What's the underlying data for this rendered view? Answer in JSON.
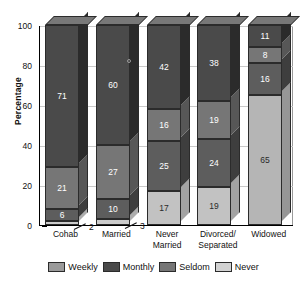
{
  "chart_data": {
    "type": "bar",
    "subtype": "stacked-3d-column",
    "title": "",
    "xlabel": "",
    "ylabel": "Percentage",
    "ylim": [
      0,
      100
    ],
    "yticks": [
      0,
      20,
      40,
      60,
      80,
      100
    ],
    "grid": true,
    "legend_position": "bottom",
    "categories": [
      "Cohab",
      "Married",
      "Never Married",
      "Divorced/ Separated",
      "Widowed"
    ],
    "category_lines": [
      [
        "Cohab",
        ""
      ],
      [
        "Married",
        ""
      ],
      [
        "Never",
        "Married"
      ],
      [
        "Divorced/",
        "Separated"
      ],
      [
        "Widowed",
        ""
      ]
    ],
    "stack_order_bottom_to_top": [
      "Never",
      "Seldom",
      "Monthly",
      "Weekly"
    ],
    "series": [
      {
        "name": "Weekly",
        "color": "#9a9a9a",
        "values": [
          71,
          60,
          42,
          38,
          11
        ]
      },
      {
        "name": "Monthly",
        "color": "#4a4a4a",
        "values": [
          21,
          27,
          16,
          19,
          8
        ]
      },
      {
        "name": "Seldom",
        "color": "#737373",
        "values": [
          6,
          10,
          25,
          24,
          16
        ]
      },
      {
        "name": "Never",
        "color": "#c9c9c9",
        "values": [
          2,
          3,
          17,
          19,
          65
        ]
      }
    ],
    "bar_segments": [
      {
        "category": "Cohab",
        "segments": [
          {
            "series": "Weekly",
            "value": 71,
            "label": "71",
            "color": "#4a4a4a",
            "label_color": "light",
            "callout": false
          },
          {
            "series": "Monthly",
            "value": 21,
            "label": "21",
            "color": "#767676",
            "label_color": "light",
            "callout": false
          },
          {
            "series": "Seldom",
            "value": 6,
            "label": "6",
            "color": "#5d5d5d",
            "label_color": "light",
            "callout": false
          },
          {
            "series": "Never",
            "value": 2,
            "label": "2",
            "color": "#cccccc",
            "label_color": "dark",
            "callout": true
          }
        ]
      },
      {
        "category": "Married",
        "segments": [
          {
            "series": "Weekly",
            "value": 60,
            "label": "60",
            "color": "#4a4a4a",
            "label_color": "light",
            "callout": false
          },
          {
            "series": "Monthly",
            "value": 27,
            "label": "27",
            "color": "#767676",
            "label_color": "light",
            "callout": false
          },
          {
            "series": "Seldom",
            "value": 10,
            "label": "10",
            "color": "#5d5d5d",
            "label_color": "light",
            "callout": false
          },
          {
            "series": "Never",
            "value": 3,
            "label": "3",
            "color": "#cccccc",
            "label_color": "dark",
            "callout": true
          }
        ]
      },
      {
        "category": "Never Married",
        "segments": [
          {
            "series": "Weekly",
            "value": 42,
            "label": "42",
            "color": "#4a4a4a",
            "label_color": "light",
            "callout": false
          },
          {
            "series": "Monthly",
            "value": 16,
            "label": "16",
            "color": "#767676",
            "label_color": "light",
            "callout": false
          },
          {
            "series": "Seldom",
            "value": 25,
            "label": "25",
            "color": "#5d5d5d",
            "label_color": "light",
            "callout": false
          },
          {
            "series": "Never",
            "value": 17,
            "label": "17",
            "color": "#c2c2c2",
            "label_color": "dark",
            "callout": false
          }
        ]
      },
      {
        "category": "Divorced/ Separated",
        "segments": [
          {
            "series": "Weekly",
            "value": 38,
            "label": "38",
            "color": "#4a4a4a",
            "label_color": "light",
            "callout": false
          },
          {
            "series": "Monthly",
            "value": 19,
            "label": "19",
            "color": "#767676",
            "label_color": "light",
            "callout": false
          },
          {
            "series": "Seldom",
            "value": 24,
            "label": "24",
            "color": "#5d5d5d",
            "label_color": "light",
            "callout": false
          },
          {
            "series": "Never",
            "value": 19,
            "label": "19",
            "color": "#c2c2c2",
            "label_color": "dark",
            "callout": false
          }
        ]
      },
      {
        "category": "Widowed",
        "segments": [
          {
            "series": "Weekly",
            "value": 11,
            "label": "11",
            "color": "#4a4a4a",
            "label_color": "light",
            "callout": false
          },
          {
            "series": "Monthly",
            "value": 8,
            "label": "8",
            "color": "#767676",
            "label_color": "light",
            "callout": false
          },
          {
            "series": "Seldom",
            "value": 16,
            "label": "16",
            "color": "#5d5d5d",
            "label_color": "light",
            "callout": false
          },
          {
            "series": "Never",
            "value": 65,
            "label": "65",
            "color": "#b5b5b5",
            "label_color": "dark",
            "callout": false
          }
        ]
      }
    ],
    "legend": [
      {
        "label": "Weekly",
        "color": "#9a9a9a"
      },
      {
        "label": "Monthly",
        "color": "#4a4a4a"
      },
      {
        "label": "Seldom",
        "color": "#767676"
      },
      {
        "label": "Never",
        "color": "#d2d2d2"
      }
    ]
  },
  "axis": {
    "y_title": "Percentage",
    "y_ticks": [
      "100",
      "80",
      "60",
      "40",
      "20",
      "0"
    ]
  }
}
